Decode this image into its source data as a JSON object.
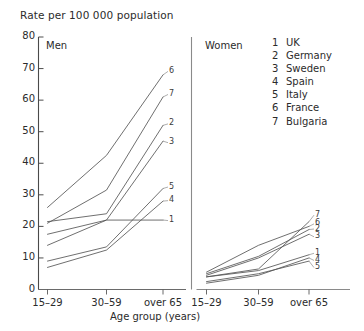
{
  "figure": {
    "title": "Rate per 100 000 population",
    "xaxis_title": "Age group (years)"
  },
  "panels": [
    {
      "key": "men",
      "label": "Men"
    },
    {
      "key": "women",
      "label": "Women"
    }
  ],
  "legend": {
    "entries": [
      {
        "num": "1",
        "name": "UK"
      },
      {
        "num": "2",
        "name": "Germany"
      },
      {
        "num": "3",
        "name": "Sweden"
      },
      {
        "num": "4",
        "name": "Spain"
      },
      {
        "num": "5",
        "name": "Italy"
      },
      {
        "num": "6",
        "name": "France"
      },
      {
        "num": "7",
        "name": "Bulgaria"
      }
    ]
  },
  "yticks": [
    "0",
    "10",
    "20",
    "30",
    "40",
    "50",
    "60",
    "70",
    "80"
  ],
  "xticks": [
    "15–29",
    "30–59",
    "over 65"
  ],
  "chart_data": {
    "type": "line",
    "title": "Rate per 100 000 population",
    "xlabel": "Age group (years)",
    "ylabel": "Rate per 100 000 population",
    "ylim": [
      0,
      80
    ],
    "ytick_step": 10,
    "grid": false,
    "legend_position": "right",
    "categories": [
      "15–29",
      "30–59",
      "over 65"
    ],
    "panels": [
      {
        "name": "Men",
        "series": [
          {
            "num": "1",
            "name": "UK",
            "values": [
              14.0,
              22.0,
              22.0
            ]
          },
          {
            "num": "2",
            "name": "Germany",
            "values": [
              21.5,
              24.0,
              52.0
            ]
          },
          {
            "num": "3",
            "name": "Sweden",
            "values": [
              17.5,
              22.0,
              47.0
            ]
          },
          {
            "num": "4",
            "name": "Spain",
            "values": [
              7.0,
              12.5,
              28.0
            ]
          },
          {
            "num": "5",
            "name": "Italy",
            "values": [
              9.0,
              13.5,
              32.0
            ]
          },
          {
            "num": "6",
            "name": "France",
            "values": [
              26.0,
              42.5,
              68.0
            ]
          },
          {
            "num": "7",
            "name": "Bulgaria",
            "values": [
              21.0,
              31.5,
              61.0
            ]
          }
        ]
      },
      {
        "name": "Women",
        "series": [
          {
            "num": "1",
            "name": "UK",
            "values": [
              4.0,
              6.0,
              11.0
            ]
          },
          {
            "num": "2",
            "name": "Germany",
            "values": [
              5.0,
              10.5,
              19.0
            ]
          },
          {
            "num": "3",
            "name": "Sweden",
            "values": [
              4.5,
              10.0,
              17.5
            ]
          },
          {
            "num": "4",
            "name": "Spain",
            "values": [
              2.0,
              4.5,
              10.0
            ]
          },
          {
            "num": "5",
            "name": "Italy",
            "values": [
              2.5,
              5.0,
              9.0
            ]
          },
          {
            "num": "6",
            "name": "France",
            "values": [
              5.5,
              14.0,
              20.0
            ]
          },
          {
            "num": "7",
            "name": "Bulgaria",
            "values": [
              4.0,
              6.5,
              21.5
            ]
          }
        ]
      }
    ]
  }
}
